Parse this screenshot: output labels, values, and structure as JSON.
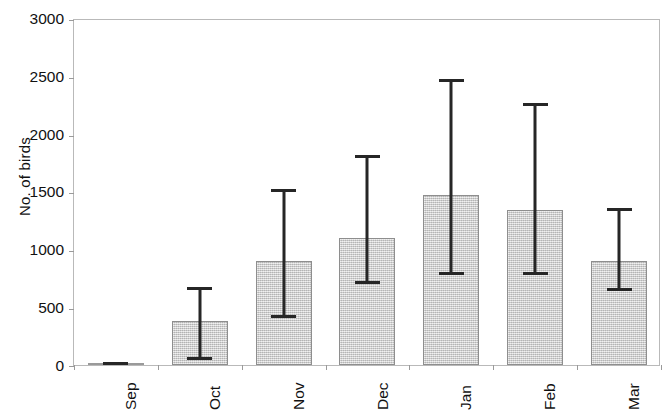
{
  "chart_data": {
    "type": "bar",
    "title": "",
    "subtitle": "",
    "xlabel": "",
    "ylabel": "No. of birds",
    "categories": [
      "Sep",
      "Oct",
      "Nov",
      "Dec",
      "Jan",
      "Feb",
      "Mar"
    ],
    "values": [
      15,
      380,
      900,
      1100,
      1470,
      1340,
      900
    ],
    "error_upper": [
      30,
      675,
      1525,
      1815,
      2470,
      2265,
      1355
    ],
    "error_lower": [
      0,
      40,
      405,
      700,
      775,
      780,
      640
    ],
    "ylim": [
      0,
      3000
    ],
    "yticks": [
      0,
      500,
      1000,
      1500,
      2000,
      2500,
      3000
    ],
    "ytick_labels": [
      "0",
      "500",
      "1000",
      "1500",
      "2000",
      "2500",
      "3000"
    ],
    "grid": false,
    "legend": null,
    "legend_position": "none",
    "series": [
      {
        "name": "No. of birds",
        "values": [
          15,
          380,
          900,
          1100,
          1470,
          1340,
          900
        ],
        "error_upper": [
          30,
          675,
          1525,
          1815,
          2470,
          2265,
          1355
        ],
        "error_lower": [
          0,
          40,
          405,
          700,
          775,
          780,
          640
        ]
      }
    ],
    "colors": {
      "bar_fill": "#cbcbcb",
      "bar_edge": "#8e8e8e",
      "error_bar": "#262626",
      "axis": "#b9b9b9",
      "text": "#111111",
      "background": "#ffffff"
    }
  }
}
